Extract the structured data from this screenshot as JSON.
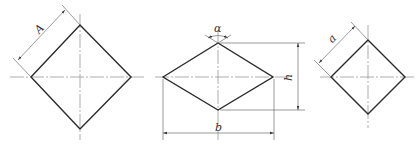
{
  "figure": {
    "views": [
      {
        "name": "large-square-rotated",
        "dimension_label": "A"
      },
      {
        "name": "rhombus",
        "angle_label": "α",
        "height_label": "h",
        "width_label": "b"
      },
      {
        "name": "small-square-rotated",
        "dimension_label": "a"
      }
    ]
  },
  "labels": {
    "left_side": "A",
    "mid_angle": "α",
    "mid_height": "h",
    "mid_width": "b",
    "right_side": "a"
  },
  "colors": {
    "outline": "#2a2a2a",
    "centerline": "#8a8a8a",
    "dimension": "#6e6e6e"
  }
}
